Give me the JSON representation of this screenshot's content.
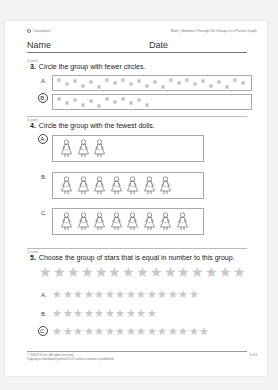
{
  "header": {
    "left": "Checkpoint",
    "right": "Math | Numbers Through 30: Groups in a Picture Graph"
  },
  "name_label": "Name",
  "date_label": "Date",
  "questions": [
    {
      "points": "(1 point)",
      "number": "3.",
      "text": "Circle the group with fewer circles.",
      "options": [
        {
          "label": "A.",
          "count": 24,
          "circled": false
        },
        {
          "label": "B.",
          "count": 12,
          "circled": true
        }
      ]
    },
    {
      "points": "(1 point)",
      "number": "4.",
      "text": "Circle the group with the fewest dolls.",
      "options": [
        {
          "label": "A.",
          "count": 3,
          "circled": true
        },
        {
          "label": "B.",
          "count": 7,
          "circled": false
        },
        {
          "label": "C.",
          "count": 8,
          "circled": false
        }
      ]
    },
    {
      "points": "(1 point)",
      "number": "5.",
      "text": "Choose the group of stars that is equal in number to this group.",
      "reference_count": 15,
      "options": [
        {
          "label": "A.",
          "count": 14,
          "circled": false
        },
        {
          "label": "B.",
          "count": 10,
          "circled": false
        },
        {
          "label": "C.",
          "count": 15,
          "circled": true
        }
      ]
    }
  ],
  "footer": {
    "copyright": "© 2008 K12 Inc. All rights reserved.",
    "notice": "Copying or distributing without K12's written consent is prohibited.",
    "page": "3 of 3"
  },
  "colors": {
    "dot": "#c8c8c8",
    "star": "#c9c9c9",
    "box_border": "#aaaaaa"
  }
}
